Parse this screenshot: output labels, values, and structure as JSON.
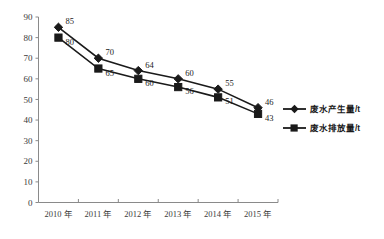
{
  "chart_data": {
    "type": "line",
    "title": "",
    "subtitle": "",
    "xlabel": "",
    "ylabel": "",
    "ylim": [
      0,
      90
    ],
    "ytick_step": 10,
    "grid": false,
    "legend_position": "right",
    "categories": [
      "2010 年",
      "2011 年",
      "2012 年",
      "2013 年",
      "2014 年",
      "2015 年"
    ],
    "yticks": [
      "0",
      "10",
      "20",
      "30",
      "40",
      "50",
      "60",
      "70",
      "80",
      "90"
    ],
    "series": [
      {
        "name": "废水产生量/t",
        "marker": "diamond",
        "color": "#1a1a1a",
        "values": [
          85,
          70,
          64,
          60,
          55,
          46
        ],
        "labels": [
          "85",
          "70",
          "64",
          "60",
          "55",
          "46"
        ]
      },
      {
        "name": "废水排放量/t",
        "marker": "square",
        "color": "#1a1a1a",
        "values": [
          80,
          65,
          60,
          56,
          51,
          43
        ],
        "labels": [
          "80",
          "65",
          "60",
          "56",
          "51",
          "43"
        ]
      }
    ]
  },
  "legend": {
    "items": [
      {
        "label": "废水产生量/t",
        "marker": "diamond"
      },
      {
        "label": "废水排放量/t",
        "marker": "square"
      }
    ]
  }
}
